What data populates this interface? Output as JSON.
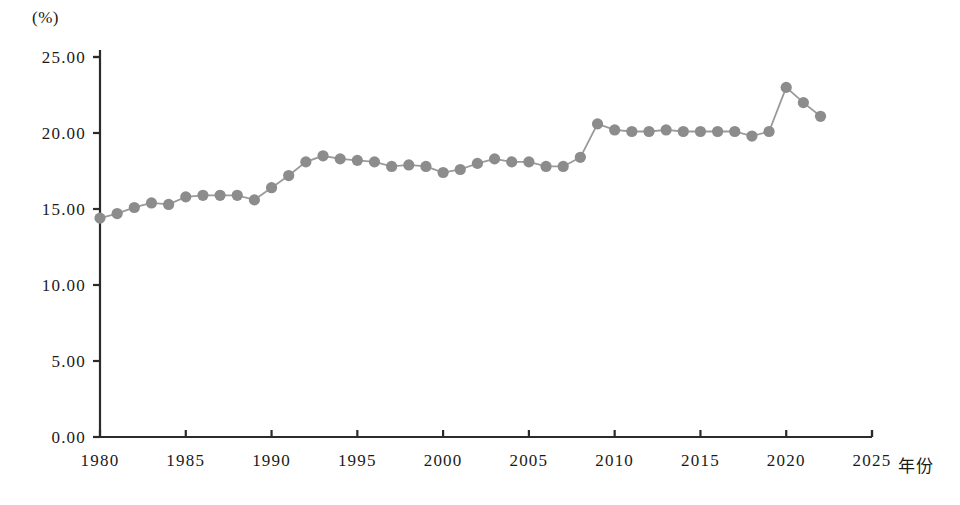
{
  "chart_data": {
    "type": "line",
    "title": "",
    "subtitle": "",
    "xlabel": "年份",
    "ylabel": "",
    "unit_label": "(%)",
    "xlim": [
      1978,
      2026
    ],
    "ylim": [
      0.0,
      25.0
    ],
    "grid": false,
    "legend": "none",
    "x_ticks": [
      "1980",
      "1985",
      "1990",
      "1995",
      "2000",
      "2005",
      "2010",
      "2015",
      "2020",
      "2025"
    ],
    "x_tick_values": [
      1980,
      1985,
      1990,
      1995,
      2000,
      2005,
      2010,
      2015,
      2020,
      2025
    ],
    "y_ticks": [
      "0.00",
      "5.00",
      "10.00",
      "15.00",
      "20.00",
      "25.00"
    ],
    "y_tick_values": [
      0.0,
      5.0,
      10.0,
      15.0,
      20.0,
      25.0
    ],
    "marker": "circle",
    "marker_color": "#8c8c8c",
    "line_color": "#9a9a9a",
    "axis_color": "#2b2b2b",
    "series": [
      {
        "name": "",
        "x": [
          1980,
          1981,
          1982,
          1983,
          1984,
          1985,
          1986,
          1987,
          1988,
          1989,
          1990,
          1991,
          1992,
          1993,
          1994,
          1995,
          1996,
          1997,
          1998,
          1999,
          2000,
          2001,
          2002,
          2003,
          2004,
          2005,
          2006,
          2007,
          2008,
          2009,
          2010,
          2011,
          2012,
          2013,
          2014,
          2015,
          2016,
          2017,
          2018,
          2019,
          2020,
          2021,
          2022
        ],
        "values": [
          14.4,
          14.7,
          15.1,
          15.4,
          15.3,
          15.8,
          15.9,
          15.9,
          15.9,
          15.6,
          16.4,
          17.2,
          18.1,
          18.5,
          18.3,
          18.2,
          18.1,
          17.8,
          17.9,
          17.8,
          17.4,
          17.6,
          18.0,
          18.3,
          18.1,
          18.1,
          17.8,
          17.8,
          18.4,
          20.6,
          20.2,
          20.1,
          20.1,
          20.2,
          20.1,
          20.1,
          20.1,
          20.1,
          19.8,
          20.1,
          23.0,
          22.0,
          21.1
        ]
      }
    ]
  },
  "axes": {
    "x_axis_name": "year-axis",
    "y_axis_name": "percent-axis"
  }
}
